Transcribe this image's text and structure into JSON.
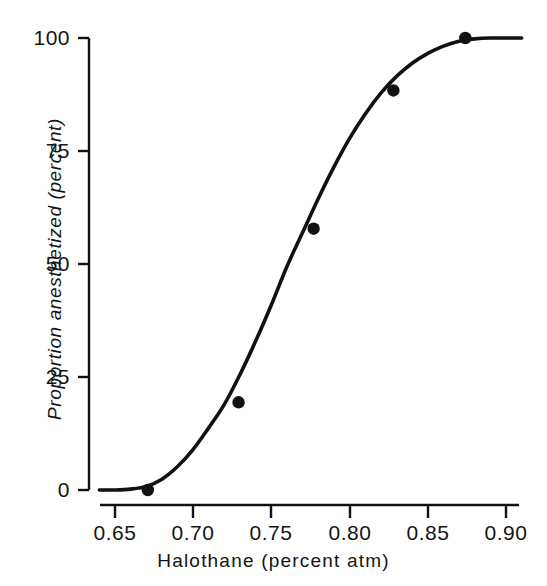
{
  "figure": {
    "background_color": "#ffffff",
    "ink_color": "#111111"
  },
  "chart_data": {
    "type": "line",
    "title": "",
    "subtitle": "",
    "xlabel": "Halothane (percent atm)",
    "ylabel": "Proportion anesthetized (percent)",
    "xlim": [
      0.635,
      0.915
    ],
    "ylim": [
      -2,
      102
    ],
    "grid": false,
    "legend": null,
    "legend_position": "none",
    "xticks": [
      0.65,
      0.7,
      0.75,
      0.8,
      0.85,
      0.9
    ],
    "xtick_labels": [
      "0.65",
      "0.70",
      "0.75",
      "0.80",
      "0.85",
      "0.90"
    ],
    "yticks": [
      0,
      25,
      50,
      75,
      100
    ],
    "ytick_labels": [
      "0",
      "25",
      "50",
      "75",
      "100"
    ],
    "series": [
      {
        "name": "Observed data points",
        "marker": "filled-circle",
        "x": [
          0.671,
          0.729,
          0.777,
          0.828,
          0.874
        ],
        "y": [
          0,
          19.4,
          57.8,
          88.4,
          100.0
        ]
      },
      {
        "name": "Fitted sigmoid curve",
        "marker": "none",
        "x": [
          0.64,
          0.65,
          0.66,
          0.67,
          0.68,
          0.69,
          0.7,
          0.71,
          0.72,
          0.73,
          0.74,
          0.75,
          0.76,
          0.77,
          0.78,
          0.79,
          0.8,
          0.81,
          0.82,
          0.83,
          0.84,
          0.85,
          0.86,
          0.87,
          0.88,
          0.89,
          0.9,
          0.91
        ],
        "y": [
          0.0,
          0.0,
          0.2,
          0.8,
          2.4,
          5.2,
          9.0,
          13.8,
          19.0,
          25.6,
          33.0,
          41.0,
          49.5,
          57.0,
          64.5,
          71.5,
          77.8,
          83.2,
          87.8,
          91.5,
          94.4,
          96.6,
          98.2,
          99.3,
          99.8,
          100.0,
          100.0,
          100.0
        ]
      }
    ]
  }
}
